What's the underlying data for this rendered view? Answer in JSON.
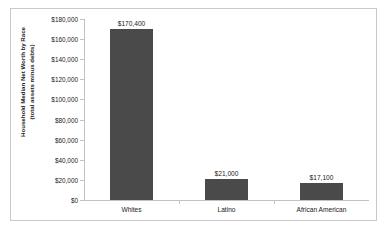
{
  "chart_data": {
    "type": "bar",
    "title": "",
    "xlabel": "",
    "ylabel_line1": "Household Median Net Worth by Race",
    "ylabel_line2": "(total assets minus debts)",
    "categories": [
      "Whites",
      "Latino",
      "African American"
    ],
    "values": [
      170400,
      21000,
      17100
    ],
    "value_labels": [
      "$170,400",
      "$21,000",
      "$17,100"
    ],
    "ylim": [
      0,
      180000
    ],
    "ytick_values": [
      0,
      20000,
      40000,
      60000,
      80000,
      100000,
      120000,
      140000,
      160000,
      180000
    ],
    "ytick_labels": [
      "$0",
      "$20,000",
      "$40,000",
      "$60,000",
      "$80,000",
      "$100,000",
      "$120,000",
      "$140,000",
      "$160,000",
      "$180,000"
    ],
    "grid": false,
    "legend": null,
    "bar_color": "#4a4a4a",
    "axis_color": "#c2c2c2",
    "border_color": "#c9c9c9",
    "background_color": "#ffffff"
  }
}
